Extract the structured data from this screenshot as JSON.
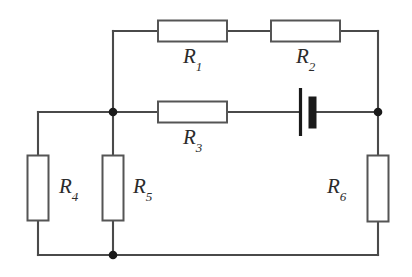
{
  "figure": {
    "background_color": "#ffffff",
    "wire_color": "#4a4a4a",
    "box_stroke_color": "#555555",
    "box_fill_color": "#ffffff",
    "node_color": "#1a1a1a",
    "battery_color": "#1a1a1a",
    "label_color": "#2b2b2b"
  },
  "components": {
    "r1": {
      "name": "R",
      "subscript": "1",
      "kind": "resistor",
      "orientation": "horizontal"
    },
    "r2": {
      "name": "R",
      "subscript": "2",
      "kind": "resistor",
      "orientation": "horizontal"
    },
    "r3": {
      "name": "R",
      "subscript": "3",
      "kind": "resistor",
      "orientation": "horizontal"
    },
    "r4": {
      "name": "R",
      "subscript": "4",
      "kind": "resistor",
      "orientation": "vertical"
    },
    "r5": {
      "name": "R",
      "subscript": "5",
      "kind": "resistor",
      "orientation": "vertical"
    },
    "r6": {
      "name": "R",
      "subscript": "6",
      "kind": "resistor",
      "orientation": "vertical"
    },
    "battery": {
      "name": "battery",
      "kind": "battery-cell",
      "orientation": "horizontal"
    }
  },
  "nodes": [
    {
      "id": "node-left-mid",
      "x": 113,
      "y": 112
    },
    {
      "id": "node-right-mid",
      "x": 378,
      "y": 112
    },
    {
      "id": "node-bottom-mid",
      "x": 113,
      "y": 255
    }
  ]
}
